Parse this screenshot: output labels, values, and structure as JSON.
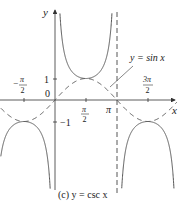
{
  "chart_data": {
    "type": "line",
    "title": "(c) y = csc x",
    "caption_prefix": "(c)",
    "caption_formula": "y = csc x",
    "xlabel": "x",
    "ylabel": "y",
    "x_ticks": [
      "-π/2",
      "π/2",
      "π",
      "3π/2"
    ],
    "y_ticks": [
      "1",
      "0",
      "-1"
    ],
    "annotation": "y = sin x",
    "series": [
      {
        "name": "y = csc x",
        "style": "solid",
        "function": "csc(x)"
      },
      {
        "name": "y = sin x",
        "style": "dashed",
        "function": "sin(x)"
      }
    ],
    "asymptotes": [
      {
        "x": "π",
        "style": "dashed",
        "type": "vertical"
      }
    ],
    "xlim": [
      -2.8,
      6.3
    ],
    "ylim": [
      -3.8,
      4.6
    ],
    "grid": false,
    "legend": "none",
    "colors": {
      "curve": "#555555",
      "axis": "#333333"
    }
  },
  "labels": {
    "y_axis": "y",
    "x_axis": "x",
    "tick_neg_half_pi_num": "π",
    "tick_half_pi_num": "π",
    "tick_three_half_pi_num": "3π",
    "tick_den": "2",
    "tick_pi": "π",
    "tick_one": "1",
    "tick_zero": "0",
    "tick_neg_one": "−1",
    "minus": "−",
    "annotation": "y = sin x",
    "caption": "(c) y = csc x"
  }
}
